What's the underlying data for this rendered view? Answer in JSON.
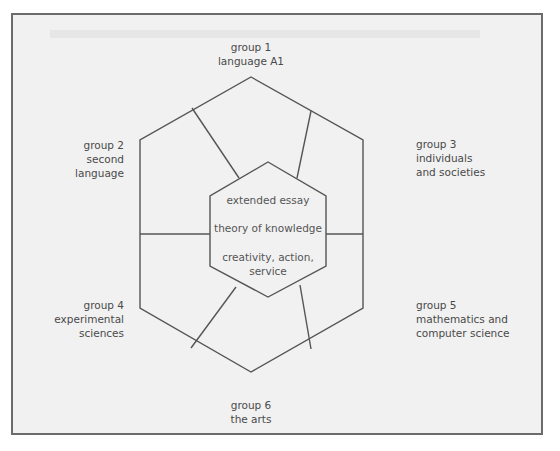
{
  "diagram": {
    "groups": [
      {
        "id": "group-1",
        "number_label": "group 1",
        "subject_lines": [
          "language A1"
        ]
      },
      {
        "id": "group-2",
        "number_label": "group 2",
        "subject_lines": [
          "second",
          "language"
        ]
      },
      {
        "id": "group-3",
        "number_label": "group 3",
        "subject_lines": [
          "individuals",
          "and societies"
        ]
      },
      {
        "id": "group-4",
        "number_label": "group 4",
        "subject_lines": [
          "experimental",
          "sciences"
        ]
      },
      {
        "id": "group-5",
        "number_label": "group 5",
        "subject_lines": [
          "mathematics and",
          "computer science"
        ]
      },
      {
        "id": "group-6",
        "number_label": "group 6",
        "subject_lines": [
          "the arts"
        ]
      }
    ],
    "core": {
      "items": [
        "extended essay",
        "theory of knowledge",
        "creativity, action,",
        "service"
      ]
    },
    "colors": {
      "line": "#555555",
      "frame_border": "#6b6b6b",
      "background": "#f1f1f1",
      "text": "#4a4a4a"
    }
  }
}
